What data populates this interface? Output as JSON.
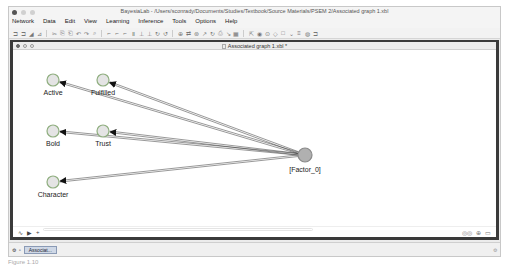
{
  "window": {
    "title": "BayesiaLab - /Users/sconrady/Documents/Studies/Textbook/Source Materials/PSEM 2/Associated graph 1.xbl"
  },
  "menubar": {
    "items": [
      "Network",
      "Data",
      "Edit",
      "View",
      "Learning",
      "Inference",
      "Tools",
      "Options",
      "Help"
    ]
  },
  "toolbar": {
    "groups": [
      [
        "new-icon",
        "open-icon",
        "save-icon",
        "print-icon"
      ],
      [
        "cut-icon",
        "copy-icon",
        "paste-icon",
        "undo-icon",
        "redo-icon",
        "find-icon"
      ],
      [
        "arc-icon",
        "arc-icon",
        "arc-icon",
        "align-icon",
        "align-icon",
        "align-icon",
        "rotate-icon",
        "rotate-icon"
      ],
      [
        "node-icon",
        "arc-add-icon",
        "node-add-icon",
        "wand-icon",
        "link-icon",
        "filter-icon",
        "delete-icon",
        "grid-icon"
      ],
      [
        "pointer-icon",
        "node-circle-icon",
        "constraint-icon",
        "decision-icon",
        "utility-icon",
        "note-icon",
        "table-icon",
        "globe-icon",
        "monitor-icon"
      ]
    ],
    "glyphs": [
      "⊐",
      "⊐",
      "◢",
      "⊿",
      "✂",
      "⎘",
      "⎗",
      "↶",
      "↷",
      "⌕",
      "⌐",
      "⌐",
      "⌐",
      "Ⅱ",
      "⊥",
      "⊥",
      "↻",
      "↺",
      "⊕",
      "⇄",
      "⊛",
      "↗",
      "↻",
      "⎙",
      "↘",
      "▦",
      "⇱",
      "◉",
      "⊙",
      "◇",
      "□",
      "⌄",
      "≡",
      "◍",
      "⊐"
    ]
  },
  "document": {
    "title": "Associated graph 1.xbl *",
    "nodes": [
      {
        "id": "Active",
        "label": "Active",
        "x": 40,
        "y": 30,
        "type": "manifest"
      },
      {
        "id": "Fulfilled",
        "label": "Fulfilled",
        "x": 90,
        "y": 30,
        "type": "manifest"
      },
      {
        "id": "Bold",
        "label": "Bold",
        "x": 40,
        "y": 81,
        "type": "manifest"
      },
      {
        "id": "Trust",
        "label": "Trust",
        "x": 90,
        "y": 81,
        "type": "manifest"
      },
      {
        "id": "Character",
        "label": "Character",
        "x": 40,
        "y": 132,
        "type": "manifest"
      },
      {
        "id": "Factor_0",
        "label": "[Factor_0]",
        "x": 292,
        "y": 105,
        "type": "latent"
      }
    ],
    "arcs": [
      {
        "from": "Factor_0",
        "to": "Active"
      },
      {
        "from": "Factor_0",
        "to": "Fulfilled"
      },
      {
        "from": "Factor_0",
        "to": "Bold"
      },
      {
        "from": "Factor_0",
        "to": "Trust"
      },
      {
        "from": "Factor_0",
        "to": "Character"
      }
    ],
    "colors": {
      "manifest_fill": "#e4e4e4",
      "manifest_stroke": "#8fae7f",
      "latent_fill": "#b0b0b0",
      "latent_stroke": "#8a8a8a",
      "arc": "#333333"
    },
    "status": {
      "left_icons": [
        "graph-mode-icon",
        "validation-mode-icon",
        "add-icon"
      ],
      "right_icons": [
        "zoom-icon",
        "lock-icon",
        "window-icon"
      ],
      "left_glyphs": [
        "∿",
        "▶",
        "+"
      ],
      "right_glyphs": [
        "◎◎",
        "⊕",
        "▭"
      ]
    }
  },
  "taskbar": {
    "task_label": "Associat..."
  },
  "caption": {
    "text": "Figure 1.10"
  }
}
